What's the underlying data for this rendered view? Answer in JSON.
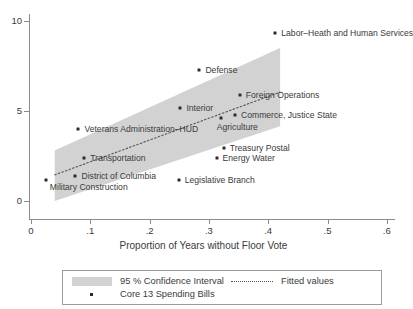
{
  "chart_data": {
    "type": "scatter",
    "title": "",
    "xlabel": "Proportion of Years without Floor Vote",
    "ylabel": "",
    "xlim": [
      0,
      0.6
    ],
    "ylim": [
      0,
      10
    ],
    "xticks": [
      "0",
      ".1",
      ".2",
      ".3",
      ".4",
      ".5",
      ".6"
    ],
    "xtick_values": [
      0,
      0.1,
      0.2,
      0.3,
      0.4,
      0.5,
      0.6
    ],
    "yticks": [
      "0",
      "5",
      "10"
    ],
    "ytick_values": [
      0,
      5,
      10
    ],
    "grid": false,
    "points": [
      {
        "label": "Military Construction",
        "x": 0.025,
        "y": 1.15,
        "label_dx": 4,
        "label_dy": 7,
        "anchor": "left"
      },
      {
        "label": "District of Columbia",
        "x": 0.075,
        "y": 1.4,
        "label_dx": 6,
        "label_dy": 0,
        "anchor": "left"
      },
      {
        "label": "Transportation",
        "x": 0.09,
        "y": 2.4,
        "label_dx": 6,
        "label_dy": 0,
        "anchor": "left"
      },
      {
        "label": "Veterans Administration–HUD",
        "x": 0.08,
        "y": 4.0,
        "label_dx": 6,
        "label_dy": 0,
        "anchor": "left"
      },
      {
        "label": "Interior",
        "x": 0.252,
        "y": 5.15,
        "label_dx": 6,
        "label_dy": 0,
        "anchor": "left"
      },
      {
        "label": "Defense",
        "x": 0.284,
        "y": 7.3,
        "label_dx": 6,
        "label_dy": 0,
        "anchor": "left"
      },
      {
        "label": "Legislative Branch",
        "x": 0.249,
        "y": 1.15,
        "label_dx": 6,
        "label_dy": 0,
        "anchor": "left"
      },
      {
        "label": "Energy Water",
        "x": 0.313,
        "y": 2.4,
        "label_dx": 6,
        "label_dy": 0,
        "anchor": "left"
      },
      {
        "label": "Treasury Postal",
        "x": 0.325,
        "y": 2.95,
        "label_dx": 6,
        "label_dy": 0,
        "anchor": "left"
      },
      {
        "label": "Agriculture",
        "x": 0.32,
        "y": 4.6,
        "label_dx": -4,
        "label_dy": 9,
        "anchor": "left"
      },
      {
        "label": "Commerce, Justice State",
        "x": 0.344,
        "y": 4.78,
        "label_dx": 6,
        "label_dy": 0,
        "anchor": "left"
      },
      {
        "label": "Foreign Operations",
        "x": 0.352,
        "y": 5.9,
        "label_dx": 6,
        "label_dy": 0,
        "anchor": "left"
      },
      {
        "label": "Labor–Heath and Human Services",
        "x": 0.412,
        "y": 9.35,
        "label_dx": 6,
        "label_dy": 0,
        "anchor": "left"
      }
    ],
    "fitted_line": {
      "x0": 0.04,
      "y0": 1.45,
      "x1": 0.42,
      "y1": 6.05
    },
    "confidence_band": {
      "level": "95 %",
      "x0": 0.04,
      "x1": 0.42,
      "lower0": 0.0,
      "upper0": 2.8,
      "lower1": 4.15,
      "upper1": 8.5
    }
  },
  "legend": {
    "ci_label": "95 % Confidence Interval",
    "fitted_label": "Fitted values",
    "points_label": "Core 13 Spending Bills"
  },
  "colors": {
    "band": "#d2d2d2",
    "point": "#2b2b2b",
    "axis": "#8c8c8c",
    "text": "#3a3a3a"
  }
}
